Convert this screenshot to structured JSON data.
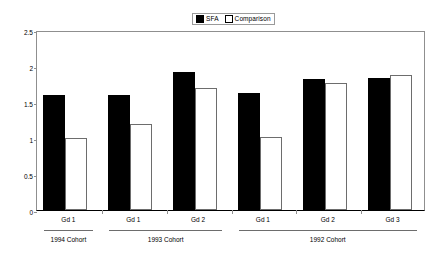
{
  "legend": {
    "position": "top-center",
    "entries": [
      {
        "label": "SFA",
        "style": "filled",
        "color": "#000000"
      },
      {
        "label": "Comparison",
        "style": "open",
        "color": "#ffffff"
      }
    ]
  },
  "axes": {
    "y": {
      "ticks": [
        "0",
        "0.5",
        "1",
        "1.5",
        "2",
        "2.5"
      ],
      "min": 0,
      "max": 2.5
    }
  },
  "cohorts": [
    {
      "label": "1994 Cohort",
      "span": 1
    },
    {
      "label": "1993 Cohort",
      "span": 2
    },
    {
      "label": "1992 Cohort",
      "span": 3
    }
  ],
  "chart_data": {
    "type": "bar",
    "title": "",
    "xlabel": "",
    "ylabel": "",
    "ylim": [
      0,
      2.5
    ],
    "grid": false,
    "legend_position": "top-center",
    "categories": [
      "Gd 1",
      "Gd 1",
      "Gd 2",
      "Gd 1",
      "Gd 2",
      "Gd 3"
    ],
    "group_labels": [
      "1994 Cohort",
      "1993 Cohort",
      "1993 Cohort",
      "1992 Cohort",
      "1992 Cohort",
      "1992 Cohort"
    ],
    "series": [
      {
        "name": "SFA",
        "values": [
          1.6,
          1.6,
          1.92,
          1.62,
          1.82,
          1.83
        ]
      },
      {
        "name": "Comparison",
        "values": [
          1.0,
          1.2,
          1.7,
          1.01,
          1.77,
          1.88
        ]
      }
    ],
    "yticks": [
      0,
      0.5,
      1,
      1.5,
      2,
      2.5
    ]
  }
}
